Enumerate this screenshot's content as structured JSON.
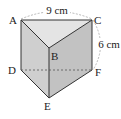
{
  "diagram": {
    "type": "triangular-prism",
    "vertices": {
      "A": "A",
      "B": "B",
      "C": "C",
      "D": "D",
      "E": "E",
      "F": "F"
    },
    "dimensions": {
      "top_edge": "9 cm",
      "height": "6 cm"
    },
    "colors": {
      "top_face": "#e6e6e6",
      "left_face": "#c9c9c9",
      "right_face": "#bdbdbd",
      "edge": "#333333",
      "dim_arc": "#9a9a9a"
    }
  }
}
